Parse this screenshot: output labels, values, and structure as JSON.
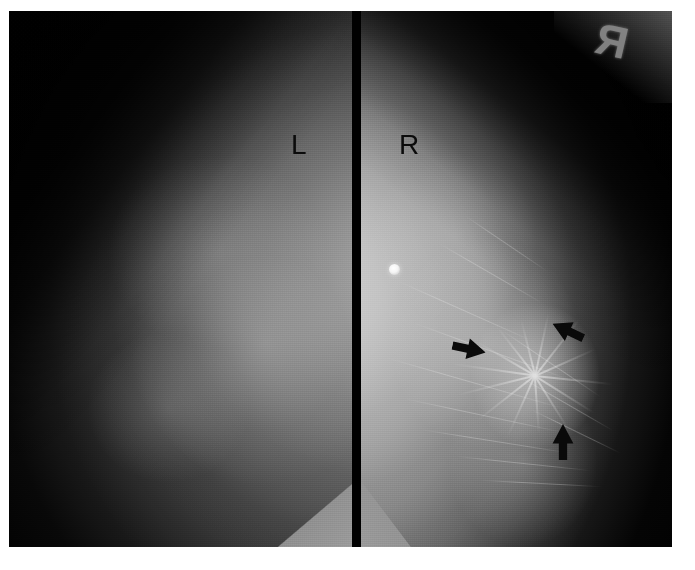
{
  "image": {
    "type": "bilateral-mammogram",
    "modality": "X-ray mammography",
    "view": "MLO bilateral comparison",
    "width": 695,
    "height": 570,
    "background_color": "#ffffff",
    "film_color": "#000000"
  },
  "panels": [
    {
      "id": "left-panel",
      "side_label": "L",
      "label_x": 291,
      "label_y": 131,
      "description": "Left breast, darker exposure, no lesion marked"
    },
    {
      "id": "right-panel",
      "side_label": "R",
      "label_x": 399,
      "label_y": 131,
      "description": "Right breast, brighter exposure, spiculated mass with architectural distortion"
    }
  ],
  "markers": {
    "radiopaque_letter": "R",
    "radiopaque_x": 586,
    "radiopaque_y": 18,
    "skin_marker_x": 389,
    "skin_marker_y": 264,
    "skin_marker_color": "#ffffff"
  },
  "arrows": [
    {
      "name": "arrow-left-lesion",
      "x": 452,
      "y": 336,
      "rotation": 12,
      "length": 34,
      "note": "points right-down at lesion margin"
    },
    {
      "name": "arrow-right-lesion",
      "x": 551,
      "y": 318,
      "rotation": 205,
      "length": 34,
      "note": "points left-down at lesion margin"
    },
    {
      "name": "arrow-bottom-lesion",
      "x": 545,
      "y": 429,
      "rotation": 270,
      "length": 36,
      "note": "points up at lesion margin"
    }
  ],
  "annotations": {
    "finding": "spiculated mass / architectural distortion",
    "finding_side": "R",
    "arrow_color": "#0a0a0a",
    "label_color": "#0b0b0b"
  },
  "spiculations": [
    {
      "angle": -172,
      "length": 84
    },
    {
      "angle": -150,
      "length": 70
    },
    {
      "angle": -128,
      "length": 62
    },
    {
      "angle": -104,
      "length": 58
    },
    {
      "angle": -78,
      "length": 64
    },
    {
      "angle": -52,
      "length": 72
    },
    {
      "angle": -24,
      "length": 66
    },
    {
      "angle": 6,
      "length": 78
    },
    {
      "angle": 32,
      "length": 70
    },
    {
      "angle": 58,
      "length": 62
    },
    {
      "angle": 86,
      "length": 58
    },
    {
      "angle": 114,
      "length": 66
    },
    {
      "angle": 142,
      "length": 74
    },
    {
      "angle": 166,
      "length": 80
    }
  ],
  "trabeculae": [
    {
      "x": 30,
      "y": 300,
      "w": 150,
      "angle": 24
    },
    {
      "x": 46,
      "y": 340,
      "w": 170,
      "angle": 20
    },
    {
      "x": 20,
      "y": 372,
      "w": 190,
      "angle": 16
    },
    {
      "x": 40,
      "y": 404,
      "w": 165,
      "angle": 12
    },
    {
      "x": 60,
      "y": 430,
      "w": 150,
      "angle": 9
    },
    {
      "x": 95,
      "y": 452,
      "w": 135,
      "angle": 6
    },
    {
      "x": 120,
      "y": 472,
      "w": 120,
      "angle": 3
    },
    {
      "x": 150,
      "y": 392,
      "w": 110,
      "angle": 30
    },
    {
      "x": 165,
      "y": 420,
      "w": 100,
      "angle": 26
    },
    {
      "x": 130,
      "y": 352,
      "w": 120,
      "angle": 34
    },
    {
      "x": 70,
      "y": 262,
      "w": 120,
      "angle": 30
    },
    {
      "x": 95,
      "y": 232,
      "w": 100,
      "angle": 34
    }
  ]
}
